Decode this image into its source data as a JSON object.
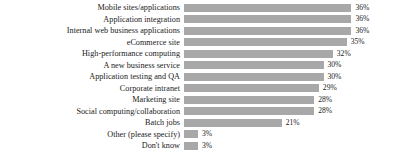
{
  "chart_data": {
    "type": "bar",
    "orientation": "horizontal",
    "title": "",
    "subtitle": "",
    "xlabel": "",
    "ylabel": "",
    "grid": false,
    "legend": null,
    "xlim": [
      0,
      40
    ],
    "value_suffix": "%",
    "bar_color": "#a8a8a8",
    "categories": [
      "Mobile sites/applications",
      "Application integration",
      "Internal web business applications",
      "eCommerce site",
      "High-performance computing",
      "A new business service",
      "Application testing and QA",
      "Corporate intranet",
      "Marketing site",
      "Social computing/collaboration",
      "Batch jobs",
      "Other (please specify)",
      "Don't know"
    ],
    "values": [
      36,
      36,
      36,
      35,
      32,
      30,
      30,
      29,
      28,
      28,
      21,
      3,
      3
    ],
    "labels": [
      "36%",
      "36%",
      "36%",
      "35%",
      "32%",
      "30%",
      "30%",
      "29%",
      "28%",
      "28%",
      "21%",
      "3%",
      "3%"
    ]
  },
  "footnote": ""
}
